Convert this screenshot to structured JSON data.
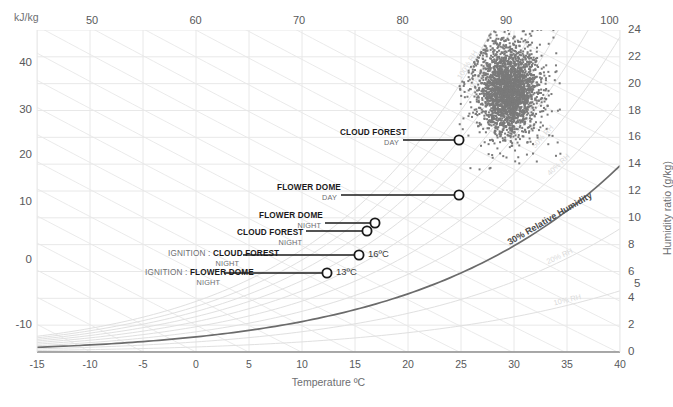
{
  "chart_data": {
    "type": "scatter",
    "title": "",
    "xlabel": "Temperature ºC",
    "ylabel": "Humidity ratio (g/kg)",
    "y2label": "kJ/kg",
    "xlim": [
      -15,
      40
    ],
    "ylim": [
      0,
      24
    ],
    "enthalpy_lim": [
      -15,
      45
    ],
    "grid": true,
    "legend": "none",
    "axes": {
      "bottom_ticks": [
        "-15",
        "-10",
        "-5",
        "0",
        "5",
        "10",
        "15",
        "20",
        "25",
        "30",
        "35",
        "40"
      ],
      "bottom_values": [
        -15,
        -10,
        -5,
        0,
        5,
        10,
        15,
        20,
        25,
        30,
        35,
        40
      ],
      "top_ticks": [
        "50",
        "60",
        "70",
        "80",
        "90",
        "100"
      ],
      "top_values": [
        50,
        60,
        70,
        80,
        90,
        100
      ],
      "left_ticks": [
        "40",
        "30",
        "20",
        "10",
        "0",
        "-10"
      ],
      "left_values": [
        40,
        30,
        20,
        10,
        0,
        -10
      ],
      "left_unit": "kJ/kg",
      "right_ticks": [
        "24",
        "22",
        "20",
        "18",
        "16",
        "14",
        "12",
        "10",
        "8",
        "6",
        "5",
        "4",
        "2",
        "0"
      ],
      "right_values": [
        24,
        22,
        20,
        18,
        16,
        14,
        12,
        10,
        8,
        6,
        5,
        4,
        2,
        0
      ]
    },
    "rh_curves": [
      {
        "label": "100% RH",
        "rh": 100
      },
      {
        "label": "90% RH",
        "rh": 90
      },
      {
        "label": "80% RH",
        "rh": 80
      },
      {
        "label": "70% RH",
        "rh": 70
      },
      {
        "label": "60% RH",
        "rh": 60
      },
      {
        "label": "50% RH",
        "rh": 50
      },
      {
        "label": "40% RH",
        "rh": 40
      },
      {
        "label": "30% Relative Humidity",
        "rh": 30,
        "highlight": true
      },
      {
        "label": "20% RH",
        "rh": 20
      },
      {
        "label": "10% RH",
        "rh": 10
      }
    ],
    "scatter": {
      "name": "measurement-cloud",
      "color": "#7a7a7a",
      "n_points": 2600,
      "x_range": [
        25.5,
        33.5
      ],
      "y_range": [
        14.5,
        23.0
      ],
      "center": [
        29.5,
        19.5
      ],
      "marker_size": 2
    },
    "annotations": [
      {
        "id": "cloud-forest-day",
        "prefix": "",
        "name": "CLOUD FOREST",
        "sub": "DAY",
        "value": "",
        "x": 26.8,
        "y": 16.0,
        "px": 459,
        "py": 140,
        "label_px": 340,
        "label_py": 128,
        "leader_from_px": 403
      },
      {
        "id": "flower-dome-day",
        "prefix": "",
        "name": "FLOWER DOME",
        "sub": "DAY",
        "value": "",
        "x": 25.0,
        "y": 12.6,
        "px": 459,
        "py": 195,
        "label_px": 277,
        "label_py": 183,
        "leader_from_px": 341
      },
      {
        "id": "flower-dome-night",
        "prefix": "",
        "name": "FLOWER DOME",
        "sub": "NIGHT",
        "value": "",
        "x": 17.2,
        "y": 9.8,
        "px": 375,
        "py": 223,
        "label_px": 259,
        "label_py": 211,
        "leader_from_px": 325
      },
      {
        "id": "cloud-forest-night",
        "prefix": "",
        "name": "CLOUD FOREST",
        "sub": "NIGHT",
        "value": "",
        "x": 16.5,
        "y": 9.3,
        "px": 367,
        "py": 231,
        "label_px": 237,
        "label_py": 228,
        "leader_from_px": 306
      },
      {
        "id": "ignition-cloud-forest-night",
        "prefix": "IGNITION : ",
        "name": "CLOUD FOREST",
        "sub": "NIGHT",
        "value": "16ºC",
        "x": 16.0,
        "y": 7.7,
        "px": 359,
        "py": 255,
        "label_px": 168,
        "label_py": 249,
        "leader_from_px": 243
      },
      {
        "id": "ignition-flower-dome-night",
        "prefix": "IGNITION : ",
        "name": "FLOWER DOME",
        "sub": "NIGHT",
        "value": "13ºC",
        "x": 13.0,
        "y": 5.9,
        "px": 327,
        "py": 273,
        "label_px": 145,
        "label_py": 268,
        "leader_from_px": 224
      }
    ]
  },
  "colors": {
    "grid": "#e8e8e8",
    "rh_line": "#e0e0e0",
    "rh_highlight": "#6b6b6b",
    "axis": "#9a9a9a",
    "scatter": "#7a7a7a",
    "text": "#58595b",
    "annotation": "#1a1a1a"
  }
}
